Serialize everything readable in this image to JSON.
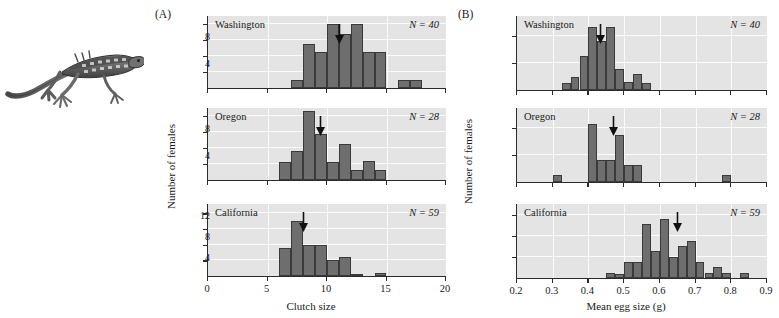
{
  "figure": {
    "organism_illustration": "lizard-illustration",
    "panels": [
      {
        "tag": "(A)",
        "xlabel": "Clutch size",
        "ylabel": "Number of females"
      },
      {
        "tag": "(B)",
        "xlabel": "Mean egg size (g)",
        "ylabel": "Number of females"
      }
    ]
  },
  "chart_data": [
    {
      "type": "bar",
      "panel": "A",
      "subpanel": "Washington",
      "title": "Washington",
      "annotation": "N = 40",
      "n_label_var": "N",
      "n_label_value": "40",
      "xlabel": "Clutch size",
      "ylabel": "Number of females",
      "xlim": [
        0,
        20
      ],
      "ylim": [
        0,
        9
      ],
      "xticks": [
        0,
        5,
        10,
        15,
        20
      ],
      "yticks": [
        2,
        4,
        6,
        8
      ],
      "grid": true,
      "bin_width": 1,
      "bin_starts": [
        7,
        8,
        9,
        10,
        11,
        12,
        13,
        14,
        16
      ],
      "values": [
        1,
        5.5,
        4.5,
        8,
        6.7,
        8,
        4.5,
        4.5,
        1
      ],
      "extra_bin_starts": [
        17
      ],
      "extra_values": [
        1
      ],
      "mean_arrow_x": 11.0
    },
    {
      "type": "bar",
      "panel": "A",
      "subpanel": "Oregon",
      "title": "Oregon",
      "annotation": "N = 28",
      "n_label_var": "N",
      "n_label_value": "28",
      "xlabel": "Clutch size",
      "ylabel": "Number of females",
      "xlim": [
        0,
        20
      ],
      "ylim": [
        0,
        9
      ],
      "xticks": [
        0,
        5,
        10,
        15,
        20
      ],
      "yticks": [
        2,
        4,
        6,
        8
      ],
      "grid": true,
      "bin_width": 1,
      "bin_starts": [
        6,
        7,
        8,
        9,
        10,
        11,
        12,
        13,
        14
      ],
      "values": [
        2.3,
        3.6,
        8.6,
        5.8,
        2.3,
        4.5,
        1.3,
        2.4,
        1.2
      ],
      "mean_arrow_x": 9.4
    },
    {
      "type": "bar",
      "panel": "A",
      "subpanel": "California",
      "title": "California",
      "annotation": "N = 59",
      "n_label_var": "N",
      "n_label_value": "59",
      "xlabel": "Clutch size",
      "ylabel": "Number of females",
      "xlim": [
        0,
        20
      ],
      "ylim": [
        0,
        23
      ],
      "xticks": [
        0,
        5,
        10,
        15,
        20
      ],
      "yticks": [
        5,
        10,
        15,
        20
      ],
      "grid": true,
      "bin_width": 1,
      "bin_starts": [
        6,
        7,
        8,
        9,
        10,
        11,
        12,
        14
      ],
      "values": [
        9,
        17.5,
        10,
        10,
        5,
        6.2,
        0.8,
        0.9
      ],
      "mean_arrow_x": 8.0
    },
    {
      "type": "bar",
      "panel": "B",
      "subpanel": "Washington",
      "title": "Washington",
      "annotation": "N = 40",
      "n_label_var": "N",
      "n_label_value": "40",
      "xlabel": "Mean egg size (g)",
      "ylabel": "Number of females",
      "xlim": [
        0.2,
        0.9
      ],
      "ylim": [
        0,
        11
      ],
      "xticks": [
        0.2,
        0.3,
        0.4,
        0.5,
        0.6,
        0.7,
        0.8,
        0.9
      ],
      "yticks": [
        4,
        8
      ],
      "grid": true,
      "bin_width": 0.025,
      "bin_starts": [
        0.325,
        0.35,
        0.375,
        0.4,
        0.425,
        0.45,
        0.475,
        0.5,
        0.525
      ],
      "values": [
        1,
        2,
        5,
        9.3,
        7.3,
        9.4,
        3.1,
        1.2,
        2.4
      ],
      "extra_bin_starts": [
        0.55
      ],
      "extra_values": [
        1
      ],
      "mean_arrow_x": 0.433
    },
    {
      "type": "bar",
      "panel": "B",
      "subpanel": "Oregon",
      "title": "Oregon",
      "annotation": "N = 28",
      "n_label_var": "N",
      "n_label_value": "28",
      "xlabel": "Mean egg size (g)",
      "ylabel": "Number of females",
      "xlim": [
        0.2,
        0.9
      ],
      "ylim": [
        0,
        11
      ],
      "xticks": [
        0.2,
        0.3,
        0.4,
        0.5,
        0.6,
        0.7,
        0.8,
        0.9
      ],
      "yticks": [
        4,
        8
      ],
      "grid": true,
      "bin_width": 0.025,
      "bin_starts": [
        0.3,
        0.4,
        0.425,
        0.45,
        0.475,
        0.5,
        0.525,
        0.775
      ],
      "values": [
        1,
        8.6,
        3.3,
        3.3,
        7,
        2.5,
        2.5,
        1
      ],
      "mean_arrow_x": 0.468
    },
    {
      "type": "bar",
      "panel": "B",
      "subpanel": "California",
      "title": "California",
      "annotation": "N = 59",
      "n_label_var": "N",
      "n_label_value": "59",
      "xlabel": "Mean egg size (g)",
      "ylabel": "Number of females",
      "xlim": [
        0.2,
        0.9
      ],
      "ylim": [
        0,
        14
      ],
      "xticks": [
        0.2,
        0.3,
        0.4,
        0.5,
        0.6,
        0.7,
        0.8,
        0.9
      ],
      "yticks": [
        4,
        8,
        12
      ],
      "grid": true,
      "bin_width": 0.025,
      "bin_starts": [
        0.45,
        0.475,
        0.5,
        0.525,
        0.55,
        0.575,
        0.6,
        0.625,
        0.65,
        0.675,
        0.7,
        0.725,
        0.75,
        0.775,
        0.825
      ],
      "values": [
        1,
        0.8,
        3,
        3,
        10.2,
        5.2,
        11.2,
        4,
        6,
        7,
        3,
        0.9,
        2,
        0.9,
        0.9
      ],
      "mean_arrow_x": 0.648
    }
  ]
}
